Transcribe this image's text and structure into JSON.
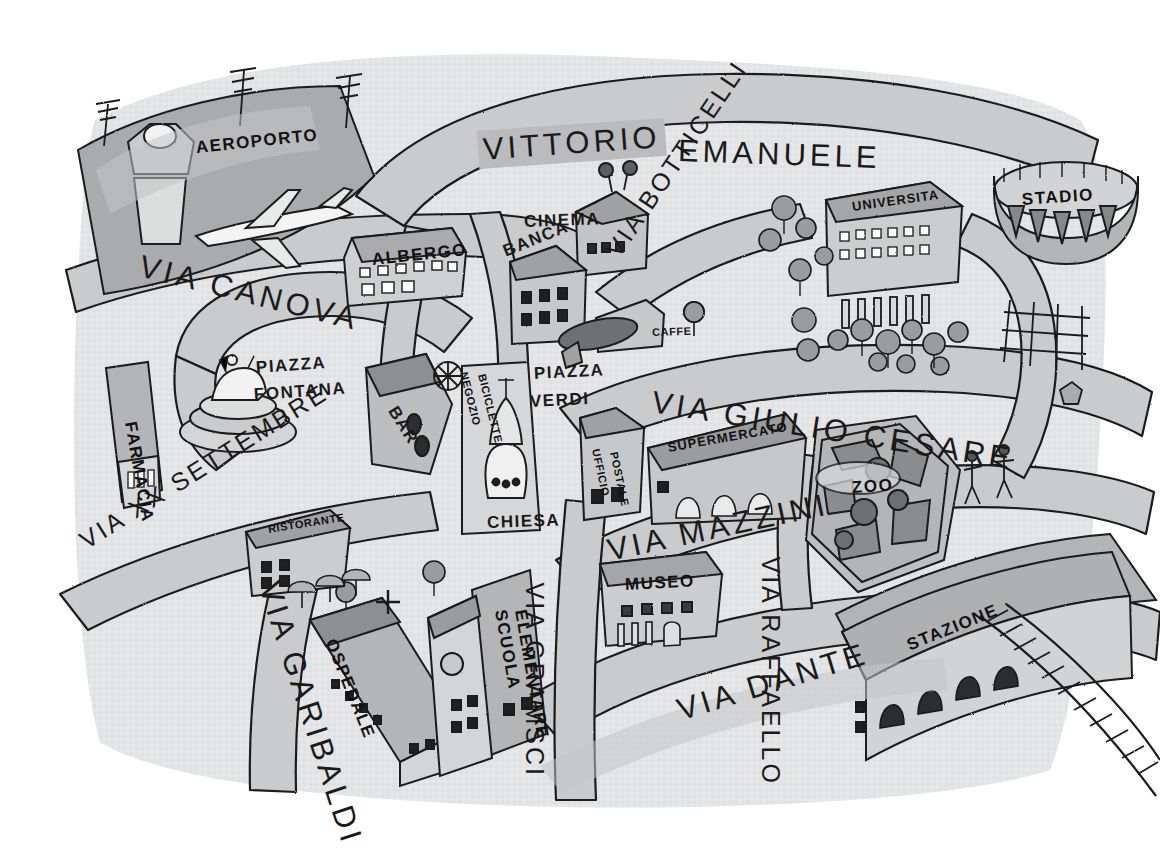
{
  "map": {
    "title": "Mappa della citta",
    "kind": "hand-drawn illustrated town map",
    "language": "Italian",
    "palette": {
      "paper": "#ffffff",
      "map_wash": "#e3e4e5",
      "road_gray": "#c9cbcc",
      "band_gray": "#b9bbbc",
      "building_gray": "#a9abac",
      "dark_gray": "#7d7f80",
      "ink": "#1a1a1a"
    }
  },
  "streets": [
    {
      "id": "via-canova",
      "label": "VIA CANOVA",
      "x": 140,
      "y": 248,
      "rot": 14,
      "size": "big"
    },
    {
      "id": "vittorio-emanuele",
      "label": "VITTORIO",
      "x": 478,
      "y": 131,
      "rot": -4,
      "size": "big",
      "banner": true
    },
    {
      "id": "emanuele",
      "label": "EMANUELE",
      "x": 678,
      "y": 133,
      "rot": 2,
      "size": "big"
    },
    {
      "id": "via-botticelli",
      "label": "VIA BOTTICELLI",
      "x": 612,
      "y": 240,
      "rot": -56,
      "size": "std"
    },
    {
      "id": "via-giulio-cesare",
      "label": "VIA GIULIO CESARE",
      "x": 652,
      "y": 384,
      "rot": 9,
      "size": "big"
    },
    {
      "id": "via-mazzini",
      "label": "VIA MAZZINI",
      "x": 608,
      "y": 533,
      "rot": -12,
      "size": "big"
    },
    {
      "id": "via-dante",
      "label": "VIA DANTE",
      "x": 678,
      "y": 693,
      "rot": -17,
      "size": "big"
    },
    {
      "id": "via-raffaello",
      "label": "VIA RAFFAELLO",
      "x": 770,
      "y": 542,
      "rot": 90,
      "size": "std"
    },
    {
      "id": "via-gramsci",
      "label": "VIA GRAMSCI",
      "x": 534,
      "y": 568,
      "rot": 90,
      "size": "std"
    },
    {
      "id": "via-garibaldi",
      "label": "VIA GARIBALDI",
      "x": 268,
      "y": 565,
      "rot": 72,
      "size": "big"
    },
    {
      "id": "via-xx-settembre",
      "label": "VIA XX SETTEMBRE",
      "x": 82,
      "y": 528,
      "rot": -32,
      "size": "std"
    }
  ],
  "piazzas": [
    {
      "id": "piazza-fontana-l1",
      "label": "PIAZZA",
      "x": 256,
      "y": 358,
      "rot": -4
    },
    {
      "id": "piazza-fontana-l2",
      "label": "FONTANA",
      "x": 254,
      "y": 385,
      "rot": -4
    },
    {
      "id": "piazza-verdi-l1",
      "label": "PIAZZA",
      "x": 534,
      "y": 364,
      "rot": -3
    },
    {
      "id": "piazza-verdi-l2",
      "label": "VERDI",
      "x": 530,
      "y": 392,
      "rot": -3
    }
  ],
  "places": [
    {
      "id": "aeroporto",
      "label": "AEROPORTO",
      "x": 196,
      "y": 138,
      "rot": -6,
      "size": "big",
      "onband": true
    },
    {
      "id": "albergo",
      "label": "ALBERGO",
      "x": 372,
      "y": 250,
      "rot": -6,
      "size": "poi",
      "onband": true
    },
    {
      "id": "cinema",
      "label": "CINEMA",
      "x": 524,
      "y": 212,
      "rot": -2,
      "size": "poi"
    },
    {
      "id": "banca",
      "label": "BANCA",
      "x": 504,
      "y": 242,
      "rot": -22,
      "size": "poi"
    },
    {
      "id": "caffe",
      "label": "CAFFE",
      "x": 652,
      "y": 326,
      "rot": -2,
      "size": "xs"
    },
    {
      "id": "universita",
      "label": "UNIVERSITA",
      "x": 852,
      "y": 199,
      "rot": -8,
      "size": "sm",
      "onband": true
    },
    {
      "id": "stadio",
      "label": "STADIO",
      "x": 1022,
      "y": 190,
      "rot": -4,
      "size": "poi",
      "onband": true
    },
    {
      "id": "farmacia",
      "label": "FARMACIA",
      "x": 130,
      "y": 412,
      "rot": 80,
      "size": "poi",
      "onband": true
    },
    {
      "id": "bar",
      "label": "BAR",
      "x": 392,
      "y": 398,
      "rot": 58,
      "size": "poi"
    },
    {
      "id": "negozio",
      "label": "NEGOZIO",
      "x": 464,
      "y": 366,
      "rot": 76,
      "size": "xs",
      "onband": true
    },
    {
      "id": "biciclette",
      "label": "BICICLETTE",
      "x": 482,
      "y": 368,
      "rot": 76,
      "size": "xs",
      "onband": true
    },
    {
      "id": "chiesa",
      "label": "CHIESA",
      "x": 487,
      "y": 513,
      "rot": -2,
      "size": "poi"
    },
    {
      "id": "ufficio",
      "label": "UFFICIO",
      "x": 596,
      "y": 443,
      "rot": 78,
      "size": "xs",
      "onband": true
    },
    {
      "id": "postale",
      "label": "POSTALE",
      "x": 614,
      "y": 446,
      "rot": 78,
      "size": "xs",
      "onband": true
    },
    {
      "id": "supermercato",
      "label": "SUPERMERCATO",
      "x": 668,
      "y": 440,
      "rot": -10,
      "size": "sm",
      "onband": true
    },
    {
      "id": "zoo",
      "label": "ZOO",
      "x": 852,
      "y": 478,
      "rot": -4,
      "size": "big",
      "onband": true
    },
    {
      "id": "ristorante",
      "label": "RISTORANTE",
      "x": 268,
      "y": 523,
      "rot": -9,
      "size": "xs",
      "onband": true
    },
    {
      "id": "museo",
      "label": "MUSEO",
      "x": 625,
      "y": 575,
      "rot": -3,
      "size": "big",
      "onband": true
    },
    {
      "id": "ospedale",
      "label": "OSPEDALE",
      "x": 330,
      "y": 630,
      "rot": 68,
      "size": "poi",
      "onband": true
    },
    {
      "id": "scuola",
      "label": "SCUOLA",
      "x": 500,
      "y": 600,
      "rot": 80,
      "size": "poi",
      "onband": true
    },
    {
      "id": "elementare",
      "label": "ELEMENTARE",
      "x": 520,
      "y": 600,
      "rot": 80,
      "size": "poi",
      "onband": true
    },
    {
      "id": "stazione",
      "label": "STAZIONE",
      "x": 908,
      "y": 636,
      "rot": -22,
      "size": "big",
      "onband": true
    }
  ],
  "icons": [
    {
      "id": "airplane-icon",
      "name": "airplane-icon"
    },
    {
      "id": "control-tower-icon",
      "name": "control-tower-icon"
    },
    {
      "id": "fountain-icon",
      "name": "horse-fountain-icon"
    },
    {
      "id": "church-dome-icon",
      "name": "church-dome-icon"
    },
    {
      "id": "tram-icon",
      "name": "tram-icon"
    },
    {
      "id": "bicycle-wheel-icon",
      "name": "bicycle-wheel-icon"
    },
    {
      "id": "stadium-icon",
      "name": "stadium-icon"
    },
    {
      "id": "railway-icon",
      "name": "railway-tracks-icon"
    },
    {
      "id": "tree-icon",
      "name": "tree-icon"
    },
    {
      "id": "people-icon",
      "name": "pedestrian-icon"
    },
    {
      "id": "hospital-cross-icon",
      "name": "hospital-cross-icon"
    },
    {
      "id": "flood-light-icon",
      "name": "floodlight-mast-icon"
    },
    {
      "id": "umbrella-icon",
      "name": "patio-umbrella-icon"
    }
  ]
}
